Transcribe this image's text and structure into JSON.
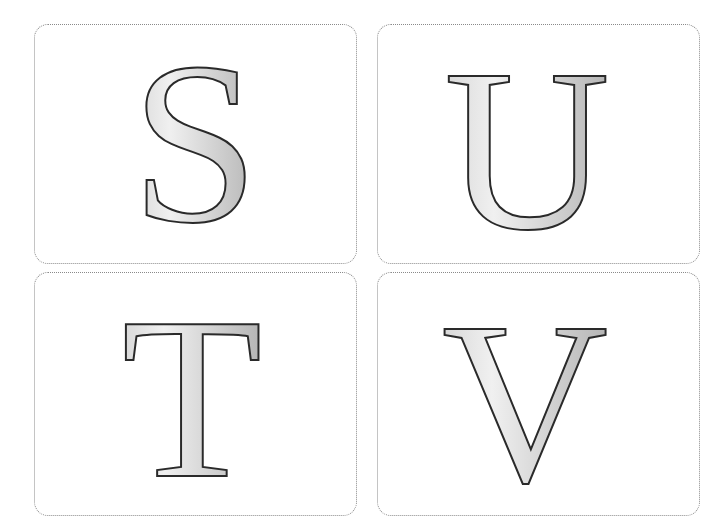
{
  "cards": [
    {
      "id": "S",
      "letter": "S"
    },
    {
      "id": "U",
      "letter": "U"
    },
    {
      "id": "T",
      "letter": "T"
    },
    {
      "id": "V",
      "letter": "V"
    }
  ],
  "style": {
    "letter_fill_light": "#f2f2f2",
    "letter_fill_dark": "#b8b8b8",
    "letter_stroke": "#2a2a2a",
    "card_border": "#8a8a8a"
  }
}
